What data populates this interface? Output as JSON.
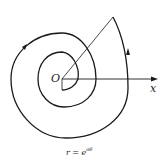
{
  "figure": {
    "origin_label": "O",
    "axis_label": "x",
    "caption": "r = e^{aθ}",
    "caption_display": "r = e",
    "caption_exp": "aθ"
  },
  "colors": {
    "stroke": "#1a1a1a",
    "background": "#ffffff"
  }
}
